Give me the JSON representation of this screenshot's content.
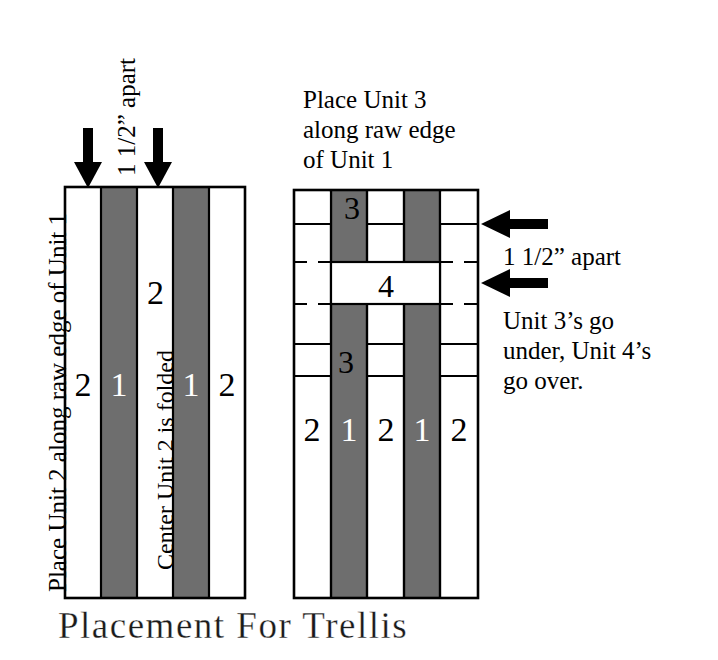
{
  "figure": {
    "title": "Placement For Trellis",
    "colors": {
      "fabric_gray": "#6e6e6e",
      "fabric_white": "#ffffff",
      "outline": "#000000",
      "arrow": "#000000",
      "background": "#ffffff"
    }
  },
  "left_panel": {
    "caption_side": "Place Unit 2 along raw edge of Unit 1",
    "caption_top": "1 1/2” apart",
    "caption_inner": "Center Unit 2 is folded",
    "arrows": [
      {
        "name": "down-arrow-left",
        "direction": "down"
      },
      {
        "name": "down-arrow-right",
        "direction": "down"
      }
    ],
    "columns": [
      {
        "label": "2",
        "fill": "white"
      },
      {
        "label": "1",
        "fill": "gray"
      },
      {
        "label": "2",
        "fill": "white"
      },
      {
        "label": "1",
        "fill": "gray"
      },
      {
        "label": "2",
        "fill": "white"
      }
    ]
  },
  "right_panel": {
    "caption_top": "Place Unit 3\nalong raw edge\nof Unit 1",
    "caption_top_lines": [
      "Place Unit 3",
      "along raw edge",
      "of Unit 1"
    ],
    "caption_spacing": "1 1/2” apart",
    "caption_weave_lines": [
      "Unit 3’s go",
      "under, Unit 4’s",
      "go over."
    ],
    "arrows": [
      {
        "name": "left-arrow-upper",
        "direction": "left"
      },
      {
        "name": "left-arrow-lower",
        "direction": "left"
      }
    ],
    "columns": [
      {
        "label": "2",
        "fill": "white"
      },
      {
        "label": "1",
        "fill": "gray"
      },
      {
        "label": "2",
        "fill": "white"
      },
      {
        "label": "1",
        "fill": "gray"
      },
      {
        "label": "2",
        "fill": "white"
      }
    ],
    "horizontal_strips": [
      {
        "label": "3",
        "position": "top",
        "weave": "under"
      },
      {
        "label": "4",
        "position": "middle",
        "weave": "over"
      },
      {
        "label": "3",
        "position": "lower",
        "weave": "under"
      }
    ]
  }
}
